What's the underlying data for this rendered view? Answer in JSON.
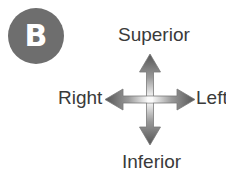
{
  "figure": {
    "panel_label": "B",
    "badge_color": "#6e6e6e",
    "badge_text_color": "#ffffff",
    "label_color": "#3a3a3a",
    "background_color": "#ffffff"
  },
  "orientation_diagram": {
    "type": "anatomical-orientation-cross",
    "arrow_style": "double-headed-cross-gradient",
    "arrow_tip_color": "#555555",
    "arrow_center_color": "#fbfbfb",
    "directions": {
      "up": "Superior",
      "down": "Inferior",
      "left": "Right",
      "right": "Left"
    },
    "axes": [
      {
        "name": "vertical",
        "positive": "Superior",
        "negative": "Inferior"
      },
      {
        "name": "horizontal",
        "positive": "Left",
        "negative": "Right"
      }
    ]
  }
}
